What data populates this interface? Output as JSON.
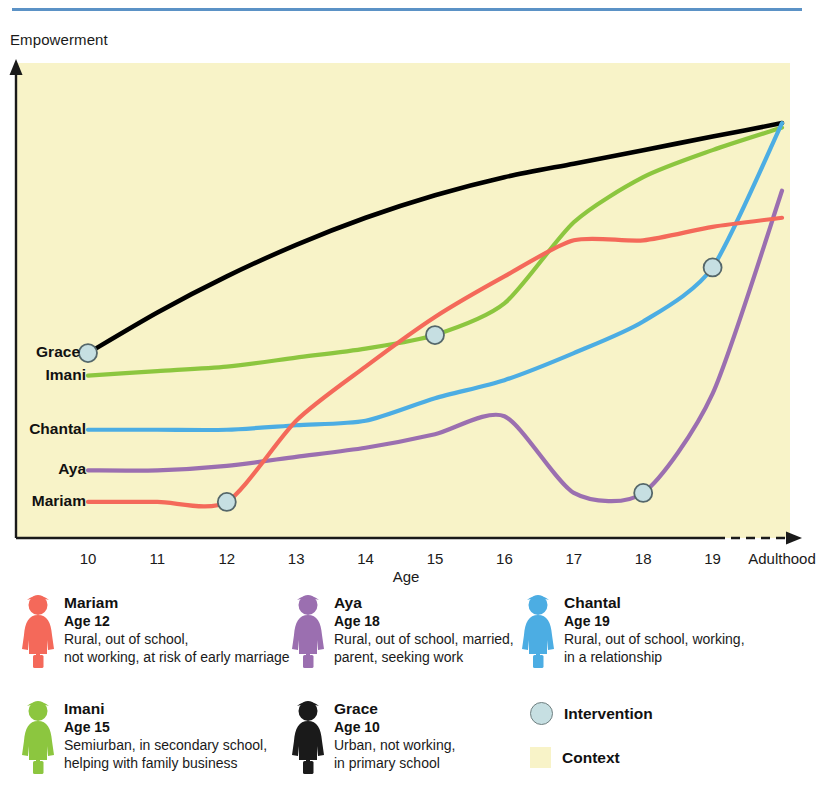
{
  "header": {
    "rule_color": "#5b92c6"
  },
  "chart_data": {
    "type": "line",
    "title": "",
    "ylabel": "Empowerment",
    "xlabel": "Age",
    "grid": false,
    "legend_position": "below-plot",
    "plot_background": "#f8f3c8",
    "x": [
      "10",
      "11",
      "12",
      "13",
      "14",
      "15",
      "16",
      "17",
      "18",
      "19",
      "Adulthood"
    ],
    "xlim": [
      "10",
      "Adulthood"
    ],
    "ylim": [
      0,
      100
    ],
    "axis_has_arrows": true,
    "x_axis_dashed_tail": true,
    "series": [
      {
        "name": "Grace",
        "color": "#000000",
        "label_x": "10",
        "values": [
          41,
          50,
          58,
          65,
          71,
          76,
          80,
          83,
          86,
          89,
          92
        ],
        "intervention_points": [
          {
            "x": "10",
            "y": 41
          }
        ]
      },
      {
        "name": "Imani",
        "color": "#8cc63f",
        "label_x": "10",
        "values": [
          36,
          37,
          38,
          40,
          42,
          45,
          52,
          70,
          80,
          86,
          91
        ],
        "intervention_points": [
          {
            "x": "15",
            "y": 45
          }
        ]
      },
      {
        "name": "Chantal",
        "color": "#4cade3",
        "label_x": "10",
        "values": [
          24,
          24,
          24,
          25,
          26,
          31,
          35,
          41,
          48,
          60,
          92
        ],
        "intervention_points": [
          {
            "x": "19",
            "y": 60
          }
        ]
      },
      {
        "name": "Aya",
        "color": "#9b6fb0",
        "label_x": "10",
        "values": [
          15,
          15,
          16,
          18,
          20,
          23,
          27,
          10,
          10,
          32,
          77
        ],
        "intervention_points": [
          {
            "x": "18",
            "y": 10
          }
        ]
      },
      {
        "name": "Mariam",
        "color": "#f4695a",
        "label_x": "10",
        "values": [
          8,
          8,
          8,
          26,
          38,
          49,
          58,
          66,
          66,
          69,
          71
        ],
        "intervention_points": [
          {
            "x": "12",
            "y": 8
          }
        ]
      }
    ],
    "series_labels": [
      "Grace",
      "Imani",
      "Chantal",
      "Aya",
      "Mariam"
    ]
  },
  "legend": {
    "people": [
      {
        "name": "Mariam",
        "age": "Age 12",
        "desc": "Rural, out of school,\nnot working, at risk of early marriage",
        "color": "#f4695a"
      },
      {
        "name": "Aya",
        "age": "Age 18",
        "desc": "Rural, out of school, married,\nparent, seeking work",
        "color": "#9b6fb0"
      },
      {
        "name": "Chantal",
        "age": "Age 19",
        "desc": "Rural, out of school, working,\nin a relationship",
        "color": "#4cade3"
      },
      {
        "name": "Imani",
        "age": "Age 15",
        "desc": "Semiurban, in secondary school,\nhelping with family business",
        "color": "#8cc63f"
      },
      {
        "name": "Grace",
        "age": "Age 10",
        "desc": "Urban, not working,\nin primary school",
        "color": "#1a1a1a"
      }
    ],
    "keys": [
      {
        "label": "Intervention",
        "swatch": "circle",
        "color": "#c6dfe2"
      },
      {
        "label": "Context",
        "swatch": "square",
        "color": "#f8f3c8"
      }
    ]
  }
}
